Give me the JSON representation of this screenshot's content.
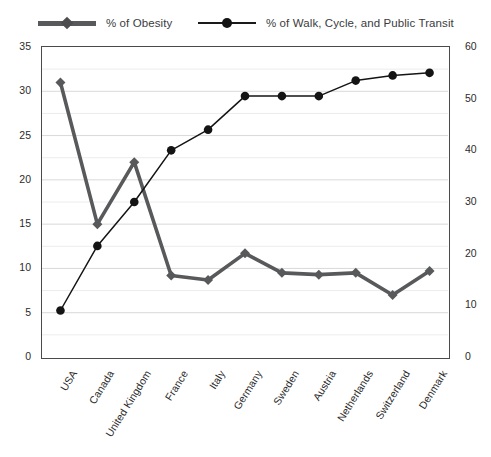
{
  "legend": {
    "position": "top",
    "items": [
      {
        "label": "% of Obesity",
        "marker": "diamond-marker-icon",
        "color": "#58595b",
        "style": "thick"
      },
      {
        "label": "% of Walk, Cycle, and Public Transit",
        "marker": "circle-marker-icon",
        "color": "#1a1a1a",
        "style": "thin"
      }
    ]
  },
  "chart_data": {
    "type": "line",
    "title": "",
    "xlabel": "",
    "ylabel": "",
    "grid": true,
    "categories": [
      "USA",
      "Canada",
      "United Kingdom",
      "France",
      "Italy",
      "Germany",
      "Sweden",
      "Austria",
      "Netherlands",
      "Switzerland",
      "Denmark"
    ],
    "axes": {
      "left": {
        "label": "% of Obesity",
        "min": 0,
        "max": 35,
        "ticks": [
          0,
          5,
          10,
          15,
          20,
          25,
          30,
          35
        ],
        "minor_step": 2.5
      },
      "right": {
        "label": "% of Walk, Cycle, and Public Transit",
        "min": 0,
        "max": 60,
        "ticks": [
          0,
          10,
          20,
          30,
          40,
          50,
          60
        ]
      }
    },
    "series": [
      {
        "name": "% of Obesity",
        "axis": "left",
        "color": "#58595b",
        "marker": "diamond",
        "values": [
          31.0,
          15.0,
          22.0,
          9.2,
          8.7,
          11.7,
          9.5,
          9.3,
          9.5,
          7.0,
          9.7
        ]
      },
      {
        "name": "% of Walk, Cycle, and Public Transit",
        "axis": "right",
        "color": "#141414",
        "marker": "circle",
        "values": [
          9.0,
          21.5,
          30.0,
          40.0,
          44.0,
          50.5,
          50.5,
          50.5,
          53.5,
          54.5,
          55.0
        ]
      }
    ]
  }
}
